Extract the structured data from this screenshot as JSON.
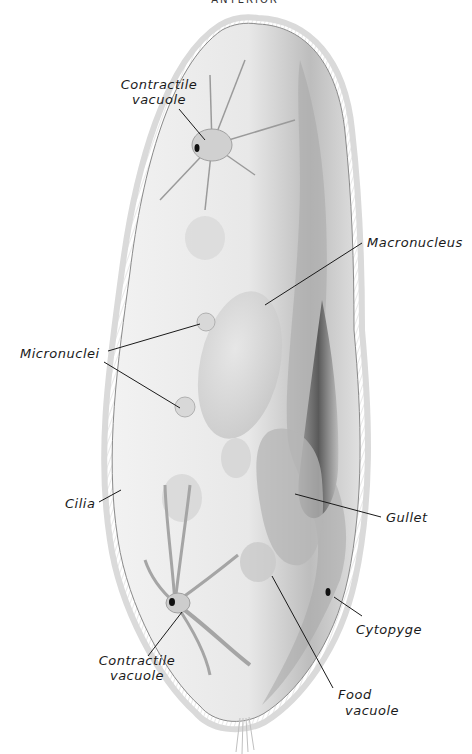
{
  "diagram": {
    "orientation_label": "ANTERIOR",
    "labels": {
      "contractile_vacuole_top": [
        "Contractile",
        "vacuole"
      ],
      "macronucleus": "Macronucleus",
      "micronuclei": "Micronuclei",
      "cilia": "Cilia",
      "gullet": "Gullet",
      "cytopyge": "Cytopyge",
      "contractile_vacuole_bottom": [
        "Contractile",
        "vacuole"
      ],
      "food_vacuole": [
        "Food",
        "vacuole"
      ]
    },
    "colors": {
      "body_fill": "#ececec",
      "body_shade": "#9a9a9a",
      "gullet_dark": "#555555",
      "cilia": "#c8c8c8",
      "label_text": "#1a1a1a"
    }
  }
}
